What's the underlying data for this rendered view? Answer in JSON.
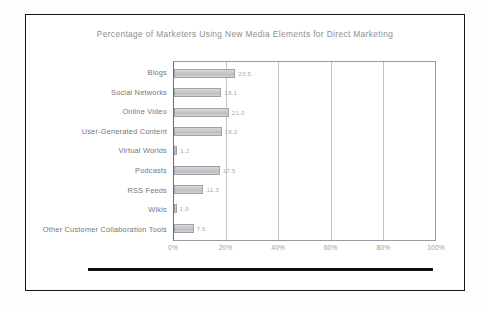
{
  "chart_data": {
    "type": "bar",
    "orientation": "horizontal",
    "title": "Percentage of Marketers Using New Media Elements for Direct Marketing",
    "xlabel": "",
    "ylabel": "",
    "xlim": [
      0,
      100
    ],
    "grid": true,
    "legend": false,
    "categories": [
      "Blogs",
      "Social Networks",
      "Online Video",
      "User-Generated Content",
      "Virtual Worlds",
      "Podcasts",
      "RSS Feeds",
      "Wikis",
      "Other Customer Collaboration Tools"
    ],
    "values": [
      23.5,
      18.1,
      21.0,
      18.2,
      1.2,
      17.5,
      11.3,
      1.0,
      7.5
    ],
    "value_labels": [
      "23.5",
      "18.1",
      "21.0",
      "18.2",
      "1.2",
      "17.5",
      "11.3",
      "1.0",
      "7.5"
    ],
    "xticks": [
      0,
      20,
      40,
      60,
      80,
      100
    ],
    "xtick_labels": [
      "0%",
      "20%",
      "40%",
      "60%",
      "80%",
      "100%"
    ],
    "bar_color": "#c7c7cb",
    "bar_border_color": "#a2a2a8",
    "grid_color": "#c4c4c9",
    "axis_color": "#6e6e73",
    "title_color": "#8e8e93",
    "label_color": "#76767b"
  }
}
